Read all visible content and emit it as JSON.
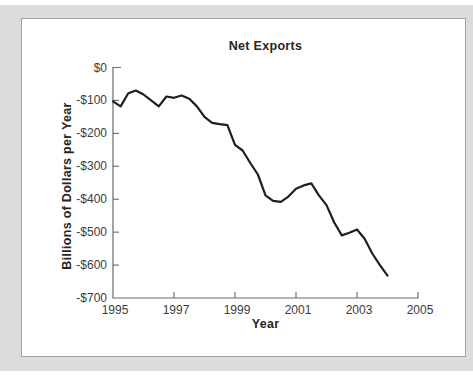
{
  "figure": {
    "background_color": "#dcdcdc",
    "panel_color": "#ffffff",
    "panel_border_color": "#a3a3a3"
  },
  "chart_data": {
    "type": "line",
    "title": "Net Exports",
    "xlabel": "Year",
    "ylabel": "Billions of Dollars per Year",
    "xlim": [
      1995,
      2005
    ],
    "ylim": [
      -700,
      0
    ],
    "grid": false,
    "legend": "none",
    "line_color": "#1f1f1f",
    "axis_color": "#6a6a6a",
    "tick_label_color": "#3c3c3c",
    "xticks": {
      "values": [
        1995,
        1997,
        1999,
        2001,
        2003,
        2005
      ],
      "labels": [
        "1995",
        "1997",
        "1999",
        "2001",
        "2003",
        "2005"
      ]
    },
    "yticks": {
      "values": [
        0,
        -100,
        -200,
        -300,
        -400,
        -500,
        -600,
        -700
      ],
      "labels": [
        "$0",
        "-$100",
        "-$200",
        "-$300",
        "-$400",
        "-$500",
        "-$600",
        "-$700"
      ]
    },
    "series": [
      {
        "name": "Net exports (quarterly)",
        "x": [
          1995.0,
          1995.25,
          1995.5,
          1995.75,
          1996.0,
          1996.25,
          1996.5,
          1996.75,
          1997.0,
          1997.25,
          1997.5,
          1997.75,
          1998.0,
          1998.25,
          1998.5,
          1998.75,
          1999.0,
          1999.25,
          1999.5,
          1999.75,
          2000.0,
          2000.25,
          2000.5,
          2000.75,
          2001.0,
          2001.25,
          2001.5,
          2001.75,
          2002.0,
          2002.25,
          2002.5,
          2002.75,
          2003.0,
          2003.25,
          2003.5,
          2003.75,
          2004.0
        ],
        "values": [
          -103,
          -118,
          -78,
          -70,
          -82,
          -100,
          -118,
          -88,
          -92,
          -85,
          -95,
          -118,
          -150,
          -168,
          -172,
          -175,
          -235,
          -252,
          -290,
          -325,
          -388,
          -405,
          -408,
          -392,
          -368,
          -358,
          -352,
          -388,
          -418,
          -470,
          -510,
          -502,
          -492,
          -520,
          -565,
          -600,
          -632
        ]
      }
    ]
  }
}
